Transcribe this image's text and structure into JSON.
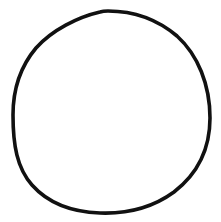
{
  "drawing": {
    "subject": "hand-drawn circle",
    "shape": "circle-outline",
    "stroke_color": "#111111",
    "background_color": "#ffffff",
    "stroke_width": 3.5
  }
}
